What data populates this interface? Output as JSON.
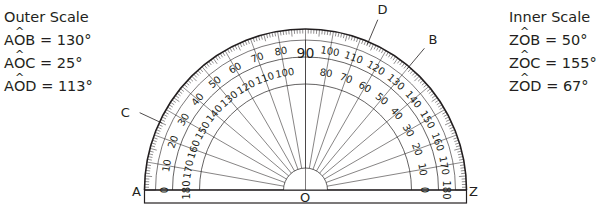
{
  "outer_scale": {
    "title": "Outer Scale",
    "readings": [
      {
        "first": "A",
        "vertex": "O",
        "last": "B",
        "value": "= 130°"
      },
      {
        "first": "A",
        "vertex": "O",
        "last": "C",
        "value": "= 25°"
      },
      {
        "first": "A",
        "vertex": "O",
        "last": "D",
        "value": "= 113°"
      }
    ]
  },
  "inner_scale": {
    "title": "Inner Scale",
    "readings": [
      {
        "first": "Z",
        "vertex": "O",
        "last": "B",
        "value": "= 50°"
      },
      {
        "first": "Z",
        "vertex": "O",
        "last": "C",
        "value": "= 155°"
      },
      {
        "first": "Z",
        "vertex": "O",
        "last": "D",
        "value": "= 67°"
      }
    ]
  },
  "protractor": {
    "points": {
      "A": {
        "label": "A"
      },
      "Z": {
        "label": "Z"
      },
      "O": {
        "label": "O"
      },
      "B": {
        "label": "B",
        "outer_angle_deg": 130
      },
      "C": {
        "label": "C",
        "outer_angle_deg": 25
      },
      "D": {
        "label": "D",
        "outer_angle_deg": 113
      }
    },
    "outer_scale_labels": [
      "0",
      "10",
      "20",
      "30",
      "40",
      "50",
      "60",
      "70",
      "80",
      "90",
      "100",
      "110",
      "120",
      "130",
      "140",
      "150",
      "160",
      "170",
      "180"
    ],
    "inner_scale_labels": [
      "180",
      "170",
      "160",
      "150",
      "140",
      "130",
      "120",
      "110",
      "100",
      "",
      "80",
      "70",
      "60",
      "50",
      "40",
      "30",
      "20",
      "10",
      "0"
    ],
    "major_step_deg": 10,
    "minor_step_deg": 1
  }
}
